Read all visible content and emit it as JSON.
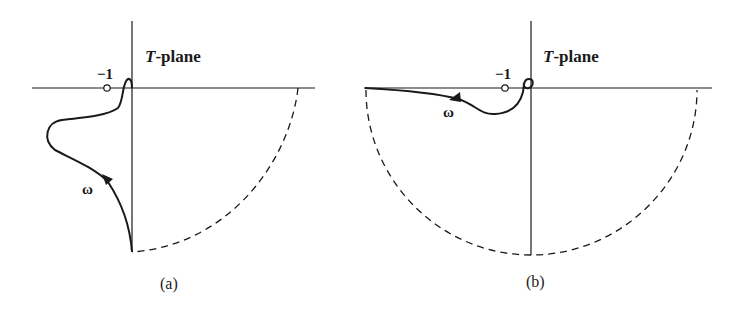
{
  "figure": {
    "panels": [
      {
        "id": "a",
        "plane_label_italic": "T",
        "plane_label_rest": "-plane",
        "minus_one_label": "−1",
        "omega_label": "ω",
        "caption": "(a)"
      },
      {
        "id": "b",
        "plane_label_italic": "T",
        "plane_label_rest": "-plane",
        "minus_one_label": "−1",
        "omega_label": "ω",
        "caption": "(b)"
      }
    ]
  },
  "colors": {
    "ink": "#1a1a1a",
    "background": "#ffffff"
  }
}
